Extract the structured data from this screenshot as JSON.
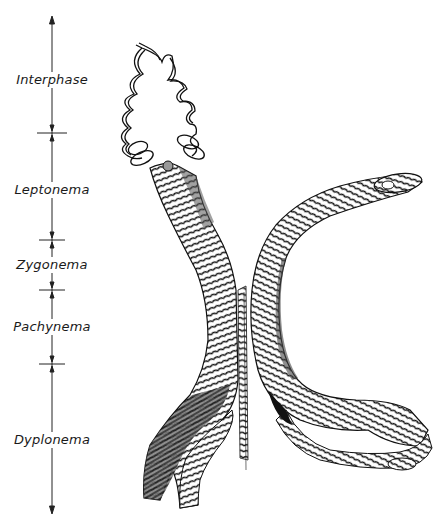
{
  "figure": {
    "type": "meiotic prophase chromosome diagram",
    "ink_color": "#111111",
    "background": "#ffffff"
  },
  "stage_axis": {
    "x": 52,
    "top_arrow_y": 18,
    "bottom_arrow_y": 512,
    "boundaries_y": [
      133,
      240,
      290,
      364
    ],
    "stages": [
      {
        "label": "Interphase",
        "y": 80
      },
      {
        "label": "Leptonema",
        "y": 190
      },
      {
        "label": "Zygonema",
        "y": 265
      },
      {
        "label": "Pachynema",
        "y": 327
      },
      {
        "label": "Dyplonema",
        "y": 440
      }
    ]
  }
}
